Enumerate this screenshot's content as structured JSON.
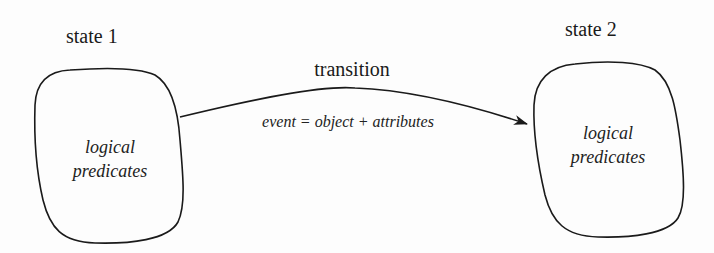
{
  "diagram": {
    "type": "state-transition",
    "states": [
      {
        "id": "state1",
        "title": "state 1",
        "body_line1": "logical",
        "body_line2": "predicates"
      },
      {
        "id": "state2",
        "title": "state 2",
        "body_line1": "logical",
        "body_line2": "predicates"
      }
    ],
    "transition": {
      "from": "state1",
      "to": "state2",
      "label": "transition",
      "sublabel": "event = object + attributes"
    },
    "colors": {
      "stroke": "#1a1a1a",
      "text": "#1a1a1a",
      "background": "#fdfdfd"
    }
  }
}
